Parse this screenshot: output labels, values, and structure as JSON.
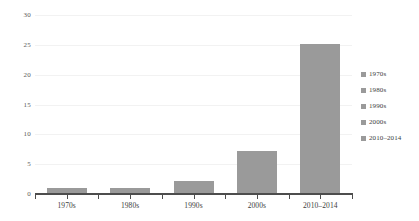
{
  "chart_data": {
    "type": "bar",
    "title": "",
    "subtitle": "",
    "xlabel": "",
    "ylabel": "",
    "categories": [
      "1970s",
      "1980s",
      "1990s",
      "2000s",
      "2010–2014"
    ],
    "values": [
      1.0,
      1.0,
      2.1,
      7.2,
      25.2
    ],
    "series": [
      {
        "name": "",
        "values": [
          1.0,
          1.0,
          2.1,
          7.2,
          25.2
        ]
      }
    ],
    "ylim": [
      0,
      30
    ],
    "xlim": [
      0,
      5
    ],
    "ytick_labels": [
      "0",
      "5",
      "10",
      "15",
      "20",
      "25",
      "30"
    ],
    "ytick_values": [
      0,
      5,
      10,
      15,
      20,
      25,
      30
    ],
    "xtick_labels": [
      "1970s",
      "1980s",
      "1990s",
      "2000s",
      "2010–2014"
    ],
    "grid": true,
    "grid_axis": "y",
    "legend_position": "right",
    "legend": [
      {
        "label": "1970s",
        "color": "#9a9a9a",
        "marker": "square"
      },
      {
        "label": "1980s",
        "color": "#9a9a9a",
        "marker": "square"
      },
      {
        "label": "1990s",
        "color": "#9a9a9a",
        "marker": "square"
      },
      {
        "label": "2000s",
        "color": "#9a9a9a",
        "marker": "square"
      },
      {
        "label": "2010–2014",
        "color": "#9a9a9a",
        "marker": "square"
      }
    ],
    "colors": {
      "bar_fill": "#9a9a9a",
      "gridline": "#f2f2f2",
      "axis": "#4d4d4d",
      "tick_label": "#3d3d3d",
      "background": "#ffffff"
    }
  }
}
